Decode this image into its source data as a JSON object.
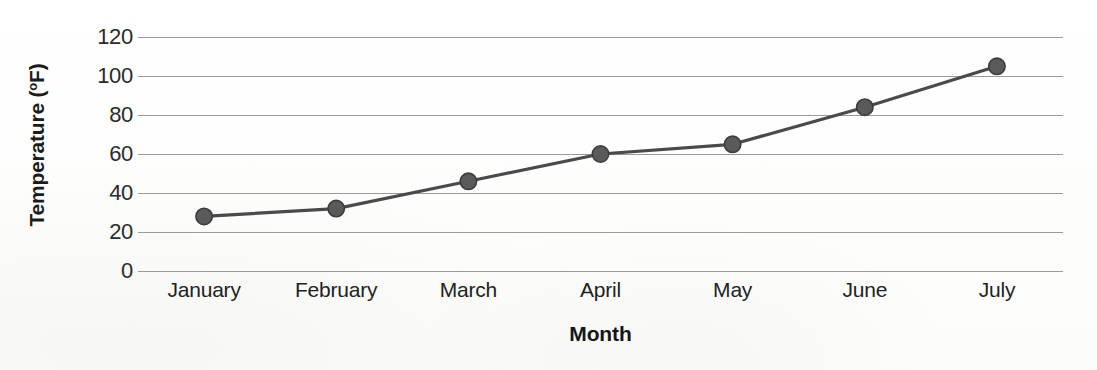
{
  "chart_data": {
    "type": "line",
    "title": "",
    "xlabel": "Month",
    "ylabel": "Temperature (°F)",
    "ylabel_main": "Temperature (",
    "ylabel_unit": "o",
    "ylabel_tail": "F)",
    "categories": [
      "January",
      "February",
      "March",
      "April",
      "May",
      "June",
      "July"
    ],
    "values": [
      28,
      32,
      46,
      60,
      65,
      84,
      105
    ],
    "series": [
      {
        "name": "Temperature",
        "values": [
          28,
          32,
          46,
          60,
          65,
          84,
          105
        ]
      }
    ],
    "ylim": [
      0,
      120
    ],
    "ytick_step": 20,
    "yticks": [
      120,
      100,
      80,
      60,
      40,
      20,
      0
    ],
    "ytick_labels": [
      "120",
      "100",
      "80",
      "60",
      "40",
      "20",
      "0"
    ],
    "grid": true,
    "grid_axis": "y",
    "legend": false,
    "legend_position": "none",
    "marker": "circle",
    "colors": {
      "line": "#4a4a4a",
      "marker": "#5a5a5a",
      "marker_edge": "#3c3c3c",
      "gridline": "#9a9a9a",
      "text": "#222222",
      "background": "#fdfdfd"
    }
  }
}
